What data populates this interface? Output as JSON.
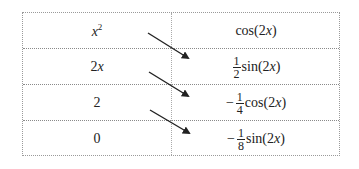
{
  "table": {
    "rows": [
      {
        "left": {
          "base": "x",
          "sup": "2"
        },
        "right": {
          "sign": "",
          "num": "",
          "den": "",
          "func": "cos(2x)",
          "func_pre": "cos(2",
          "func_var": "x",
          "func_post": ")"
        }
      },
      {
        "left": {
          "coef": "2",
          "var": "x"
        },
        "right": {
          "sign": "",
          "num": "1",
          "den": "2",
          "func_pre": "sin(2",
          "func_var": "x",
          "func_post": ")"
        }
      },
      {
        "left": {
          "text": "2"
        },
        "right": {
          "sign": "−",
          "num": "1",
          "den": "4",
          "func_pre": "cos(2",
          "func_var": "x",
          "func_post": ")"
        }
      },
      {
        "left": {
          "text": "0"
        },
        "right": {
          "sign": "−",
          "num": "1",
          "den": "8",
          "func_pre": "sin(2",
          "func_var": "x",
          "func_post": ")"
        }
      }
    ],
    "arrows": [
      "x^2 -> 1/2 sin(2x)",
      "2x -> -1/4 cos(2x)",
      "2 -> -1/8 sin(2x)"
    ]
  },
  "colors": {
    "border": "#9a9a9a",
    "arrow": "#222222",
    "text": "#222222"
  }
}
